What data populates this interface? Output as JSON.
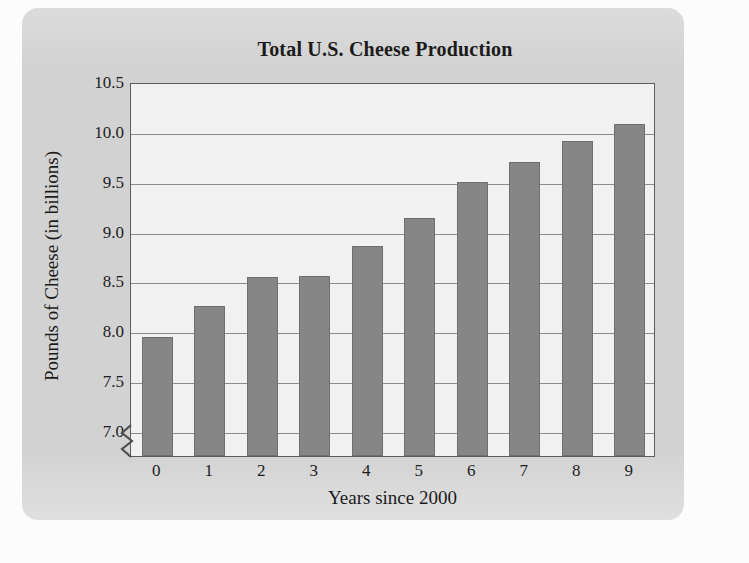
{
  "chart_data": {
    "type": "bar",
    "title": "Total U.S. Cheese Production",
    "xlabel": "Years since 2000",
    "ylabel": "Pounds of Cheese (in billions)",
    "categories": [
      "0",
      "1",
      "2",
      "3",
      "4",
      "5",
      "6",
      "7",
      "8",
      "9"
    ],
    "values": [
      7.94,
      8.25,
      8.54,
      8.55,
      8.86,
      9.14,
      9.5,
      9.7,
      9.91,
      10.08
    ],
    "ylim": [
      6.75,
      10.5
    ],
    "yticks": [
      "7.0",
      "7.5",
      "8.0",
      "8.5",
      "9.0",
      "9.5",
      "10.0",
      "10.5"
    ],
    "ytick_values": [
      7.0,
      7.5,
      8.0,
      8.5,
      9.0,
      9.5,
      10.0,
      10.5
    ],
    "grid": true,
    "legend": false,
    "axis_break": true,
    "bar_color": "#868686",
    "plot_background": "#f1f1f1",
    "panel_color": "#d2d2d2",
    "gridline_color": "#8c8c8c",
    "axis_color": "#5d5d5d"
  }
}
